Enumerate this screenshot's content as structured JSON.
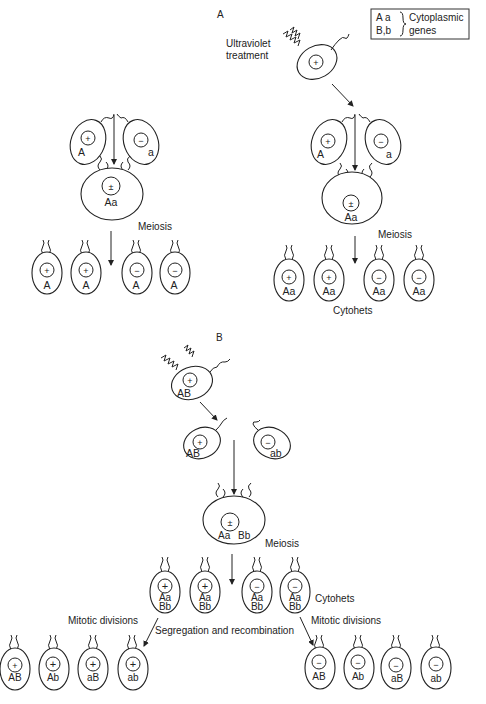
{
  "panels": {
    "a": {
      "label": "A",
      "legend": {
        "line1_genes": "A a",
        "line2_genes": "B,b",
        "line1_text": "Cytoplasmic",
        "line2_text": "genes"
      },
      "left": {
        "parents": [
          {
            "symbol": "+",
            "genotype": "A"
          },
          {
            "symbol": "−",
            "genotype": "a"
          }
        ],
        "zygote": {
          "symbol": "±",
          "genotype": "Aa"
        },
        "process_label": "Meiosis",
        "progeny": [
          {
            "symbol": "+",
            "genotype": "A"
          },
          {
            "symbol": "+",
            "genotype": "A"
          },
          {
            "symbol": "−",
            "genotype": "A"
          },
          {
            "symbol": "−",
            "genotype": "A"
          }
        ]
      },
      "right": {
        "treatment_line1": "Ultraviolet",
        "treatment_line2": "treatment",
        "treated_cell": {
          "symbol": "+"
        },
        "parents": [
          {
            "symbol": "+",
            "genotype": "A"
          },
          {
            "symbol": "−",
            "genotype": "a"
          }
        ],
        "zygote": {
          "symbol": "±",
          "genotype": "Aa"
        },
        "process_label": "Meiosis",
        "progeny": [
          {
            "symbol": "+",
            "genotype": "Aa"
          },
          {
            "symbol": "+",
            "genotype": "Aa"
          },
          {
            "symbol": "−",
            "genotype": "Aa"
          },
          {
            "symbol": "−",
            "genotype": "Aa"
          }
        ],
        "progeny_label": "Cytohets"
      }
    },
    "b": {
      "label": "B",
      "treated_cell": {
        "symbol": "+",
        "genotype": "AB"
      },
      "parents": [
        {
          "symbol": "+",
          "genotype": "AB"
        },
        {
          "symbol": "−",
          "genotype": "ab"
        }
      ],
      "zygote": {
        "symbol": "±",
        "genotype1": "Aa",
        "genotype2": "Bb"
      },
      "process_label": "Meiosis",
      "cytohets": [
        {
          "symbol": "+",
          "g1": "Aa",
          "g2": "Bb"
        },
        {
          "symbol": "+",
          "g1": "Aa",
          "g2": "Bb"
        },
        {
          "symbol": "−",
          "g1": "Aa",
          "g2": "Bb"
        },
        {
          "symbol": "−",
          "g1": "Aa",
          "g2": "Bb"
        }
      ],
      "cytohets_label": "Cytohets",
      "mitotic_left_label": "Mitotic divisions",
      "mitotic_right_label": "Mitotic divisions",
      "segregation_label": "Segregation and recombination",
      "left_progeny": [
        {
          "symbol": "+",
          "genotype": "AB"
        },
        {
          "symbol": "+",
          "genotype": "Ab"
        },
        {
          "symbol": "+",
          "genotype": "aB"
        },
        {
          "symbol": "+",
          "genotype": "ab"
        }
      ],
      "right_progeny": [
        {
          "symbol": "−",
          "genotype": "AB"
        },
        {
          "symbol": "−",
          "genotype": "Ab"
        },
        {
          "symbol": "−",
          "genotype": "aB"
        },
        {
          "symbol": "−",
          "genotype": "ab"
        }
      ]
    }
  }
}
